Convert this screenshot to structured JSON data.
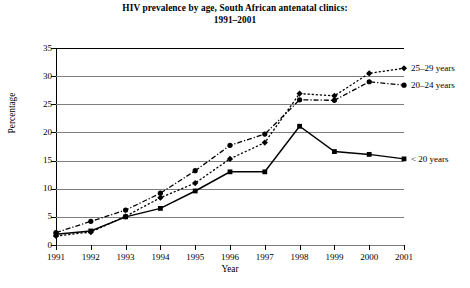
{
  "chart_data": {
    "type": "line",
    "title": "HIV prevalence by age, South African antenatal clinics: 1991–2001",
    "title_line1": "HIV prevalence by age, South African antenatal clinics:",
    "title_line2": "1991–2001",
    "xlabel": "Year",
    "ylabel": "Percentage",
    "categories": [
      "1991",
      "1992",
      "1993",
      "1994",
      "1995",
      "1996",
      "1997",
      "1998",
      "1999",
      "2000",
      "2001"
    ],
    "x": [
      1991,
      1992,
      1993,
      1994,
      1995,
      1996,
      1997,
      1998,
      1999,
      2000,
      2001
    ],
    "ylim": [
      0,
      35
    ],
    "xlim": [
      1991,
      2001
    ],
    "yticks": [
      0,
      5,
      10,
      15,
      20,
      25,
      30,
      35
    ],
    "ytick_labels": [
      "0",
      "5",
      "10",
      "15",
      "20",
      "25",
      "30",
      "35"
    ],
    "grid": true,
    "grid_axis": "y",
    "legend_position": "right-inline",
    "series": [
      {
        "name": "25–29 years",
        "label": "25–29 years",
        "marker": "diamond",
        "line_style": "dotted",
        "color": "#000000",
        "values": [
          1.6,
          2.3,
          5.1,
          8.4,
          11.0,
          15.3,
          18.2,
          26.9,
          26.5,
          30.5,
          31.4
        ]
      },
      {
        "name": "20–24 years",
        "label": "20–24 years",
        "marker": "circle",
        "line_style": "dash-dot",
        "color": "#000000",
        "values": [
          2.2,
          4.2,
          6.2,
          9.2,
          13.2,
          17.7,
          19.7,
          25.8,
          25.7,
          29.0,
          28.4
        ]
      },
      {
        "name": "< 20 years",
        "label": "< 20 years",
        "marker": "square",
        "line_style": "solid",
        "color": "#000000",
        "values": [
          1.9,
          2.5,
          5.0,
          6.5,
          9.6,
          13.0,
          13.0,
          21.1,
          16.6,
          16.1,
          15.3
        ]
      }
    ]
  }
}
